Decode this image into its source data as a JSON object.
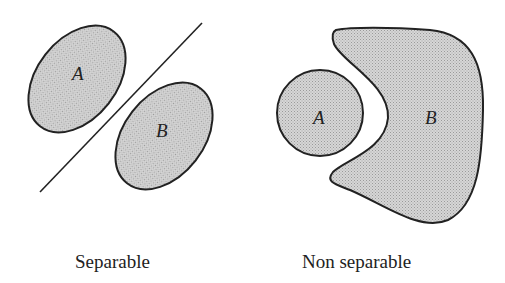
{
  "diagram": {
    "panels": [
      {
        "caption": "Separable",
        "regions": [
          {
            "label": "A",
            "shape": "ellipse"
          },
          {
            "label": "B",
            "shape": "ellipse"
          }
        ],
        "separator": "line"
      },
      {
        "caption": "Non separable",
        "regions": [
          {
            "label": "A",
            "shape": "circle"
          },
          {
            "label": "B",
            "shape": "crescent-blob"
          }
        ]
      }
    ],
    "colors": {
      "fill": "#c8c8c8",
      "stroke": "#222222",
      "background": "#ffffff"
    }
  }
}
